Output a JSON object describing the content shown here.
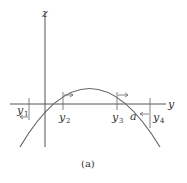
{
  "figure": {
    "caption": "(a)",
    "axes": {
      "horizontal_label": "y",
      "vertical_label": "z"
    },
    "points": [
      {
        "name": "y1",
        "base": "y",
        "sub": "1",
        "arrow": "left"
      },
      {
        "name": "y2",
        "base": "y",
        "sub": "2",
        "arrow": "right"
      },
      {
        "name": "y3",
        "base": "y",
        "sub": "3",
        "arrow": "right"
      },
      {
        "name": "a",
        "base": "a",
        "sub": "",
        "arrow": "none"
      },
      {
        "name": "y4",
        "base": "y",
        "sub": "4",
        "arrow": "left"
      }
    ],
    "curve": "downward parabola through origin and a",
    "colors": {
      "line": "#555555",
      "curve": "#666666",
      "text": "#333333"
    }
  }
}
